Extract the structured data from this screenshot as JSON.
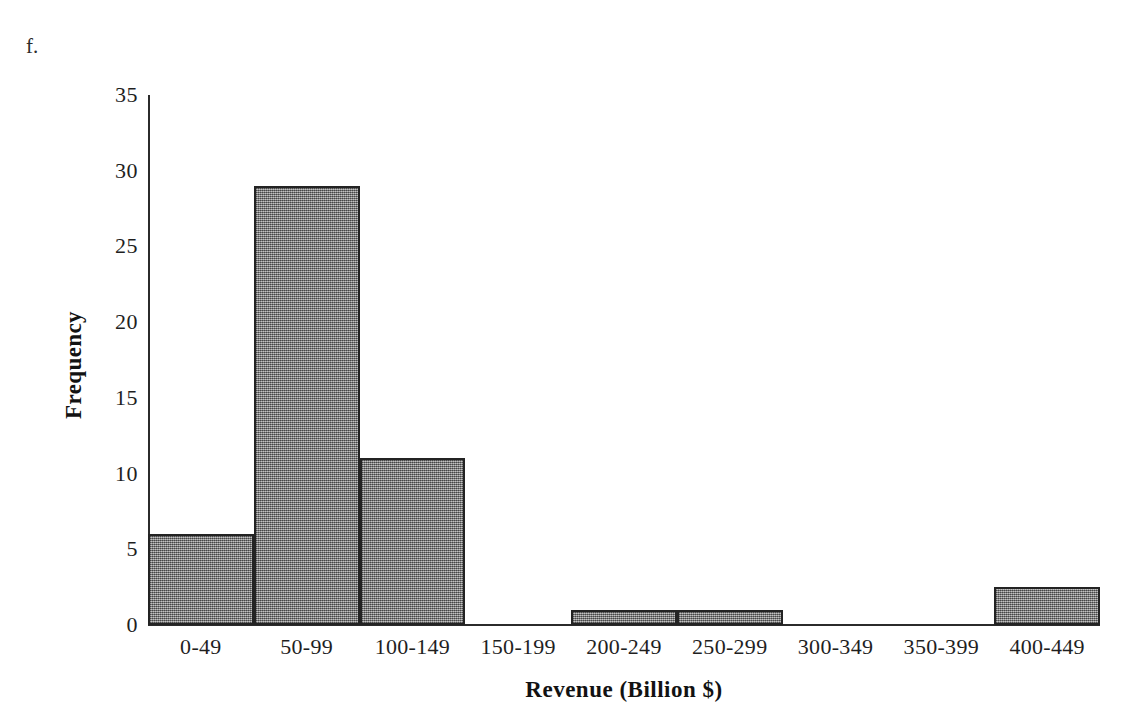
{
  "figure": {
    "label": "f."
  },
  "chart_data": {
    "type": "bar",
    "title": "",
    "subtitle": "",
    "xlabel": "Revenue (Billion $)",
    "ylabel": "Frequency",
    "categories": [
      "0-49",
      "50-99",
      "100-149",
      "150-199",
      "200-249",
      "250-299",
      "300-349",
      "350-399",
      "400-449"
    ],
    "values": [
      6,
      29,
      11,
      0,
      1,
      1,
      0,
      0,
      2.5
    ],
    "ylim": [
      0,
      35
    ],
    "y_ticks": [
      0,
      5,
      10,
      15,
      20,
      25,
      30,
      35
    ],
    "y_tick_labels": [
      "0",
      "5",
      "10",
      "15",
      "20",
      "25",
      "30",
      "35"
    ],
    "grid": false,
    "legend": null,
    "legend_position": "none",
    "annotations": [
      "f."
    ],
    "bar_fill_color": "#8a8a8a",
    "bar_border_color": "#232323",
    "axis_color": "#2b2b2b",
    "background_color": "#ffffff"
  }
}
